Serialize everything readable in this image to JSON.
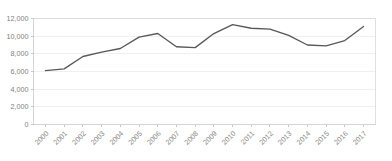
{
  "chart_data": {
    "type": "line",
    "title": "",
    "subtitle": "",
    "xlabel": "",
    "ylabel": "",
    "categories": [
      "2000",
      "2001",
      "2002",
      "2003",
      "2004",
      "2005",
      "2006",
      "2007",
      "2008",
      "2009",
      "2010",
      "2011",
      "2012",
      "2013",
      "2014",
      "2015",
      "2016",
      "2017"
    ],
    "x": [
      2000,
      2001,
      2002,
      2003,
      2004,
      2005,
      2006,
      2007,
      2008,
      2009,
      2010,
      2011,
      2012,
      2013,
      2014,
      2015,
      2016,
      2017
    ],
    "values": [
      6100,
      6300,
      7700,
      8200,
      8600,
      9900,
      10300,
      8800,
      8700,
      10300,
      11300,
      10900,
      10800,
      10100,
      9000,
      8900,
      9500,
      11100
    ],
    "series": [
      {
        "name": "Series 1",
        "color": "#58585a",
        "values": [
          6100,
          6300,
          7700,
          8200,
          8600,
          9900,
          10300,
          8800,
          8700,
          10300,
          11300,
          10900,
          10800,
          10100,
          9000,
          8900,
          9500,
          11100
        ]
      }
    ],
    "ylim": [
      0,
      12000
    ],
    "xlim": [
      2000,
      2017
    ],
    "yticks": [
      0,
      2000,
      4000,
      6000,
      8000,
      10000,
      12000
    ],
    "ytick_labels": [
      "0",
      "2,000",
      "4,000",
      "6,000",
      "8,000",
      "10,000",
      "12,000"
    ],
    "xtick_labels": [
      "2000",
      "2001",
      "2002",
      "2003",
      "2004",
      "2005",
      "2006",
      "2007",
      "2008",
      "2009",
      "2010",
      "2011",
      "2012",
      "2013",
      "2014",
      "2015",
      "2016",
      "2017"
    ],
    "xtick_label_rotation": -45,
    "grid": true,
    "grid_axis": "y",
    "legend": false,
    "legend_position": "none",
    "line_color": "#58585a",
    "grid_color": "#e9e9e9",
    "axis_color": "#c9c9c9",
    "tick_label_color": "#808080",
    "background_color": "#ffffff",
    "markers": false,
    "annotations": []
  }
}
